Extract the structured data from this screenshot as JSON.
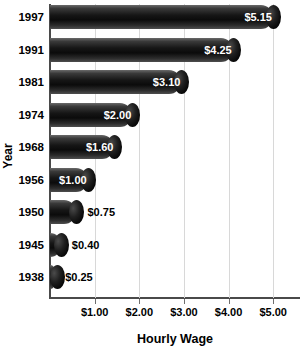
{
  "chart_data": {
    "type": "bar",
    "orientation": "horizontal",
    "title": "",
    "xlabel": "Hourly Wage",
    "ylabel": "Year",
    "categories": [
      "1997",
      "1991",
      "1981",
      "1974",
      "1968",
      "1956",
      "1950",
      "1945",
      "1938"
    ],
    "values": [
      5.15,
      4.25,
      3.1,
      2.0,
      1.6,
      1.0,
      0.75,
      0.4,
      0.25
    ],
    "value_labels": [
      "$5.15",
      "$4.25",
      "$3.10",
      "$2.00",
      "$1.60",
      "$1.00",
      "$0.75",
      "$0.40",
      "$0.25"
    ],
    "label_placement": [
      "inside",
      "inside",
      "inside",
      "inside",
      "inside",
      "inside",
      "outside",
      "outside",
      "outside"
    ],
    "xlim": [
      0,
      5.6
    ],
    "xticks": [
      1,
      2,
      3,
      4,
      5
    ],
    "xtick_labels": [
      "$1.00",
      "$2.00",
      "$3.00",
      "$4.00",
      "$5.00"
    ],
    "grid": "vertical",
    "legend": "none",
    "colors": {
      "bar_fill_dark": "#0b0b0b",
      "bar_highlight": "#6a6a6a",
      "gridline": "#d8d8d8",
      "axis": "#4a4a4a",
      "label_inside": "#ffffff",
      "label_outside": "#000000",
      "background": "#ffffff"
    }
  }
}
